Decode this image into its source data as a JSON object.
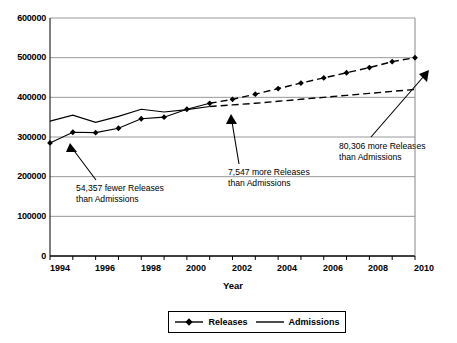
{
  "chart_data": {
    "type": "line",
    "title": "",
    "xlabel": "Year",
    "ylabel": "",
    "xlim": [
      1994,
      2010
    ],
    "ylim": [
      0,
      600000
    ],
    "grid": true,
    "legend_position": "bottom",
    "x": [
      1994,
      1995,
      1996,
      1997,
      1998,
      1999,
      2000,
      2001,
      2002,
      2003,
      2004,
      2005,
      2006,
      2007,
      2008,
      2009,
      2010
    ],
    "xtick_labels": [
      "1994",
      "1996",
      "1998",
      "2000",
      "2002",
      "2004",
      "2006",
      "2008",
      "2010"
    ],
    "xtick_values": [
      1994,
      1996,
      1998,
      2000,
      2002,
      2004,
      2006,
      2008,
      2010
    ],
    "ytick_labels": [
      "0",
      "100000",
      "200000",
      "300000",
      "400000",
      "500000",
      "600000"
    ],
    "ytick_values": [
      0,
      100000,
      200000,
      300000,
      400000,
      500000,
      600000
    ],
    "series": [
      {
        "name": "Releases",
        "marker": "diamond",
        "color": "#000000",
        "solid_through": 2001,
        "values": [
          285000,
          312000,
          311000,
          322000,
          346000,
          350000,
          370000,
          385000,
          395000,
          408000,
          422000,
          436000,
          449000,
          462000,
          475000,
          490000,
          500000
        ]
      },
      {
        "name": "Admissions",
        "marker": "none",
        "color": "#000000",
        "solid_through": 2001,
        "values": [
          340000,
          355000,
          337000,
          352000,
          370000,
          363000,
          369000,
          377000,
          381000,
          385000,
          390000,
          395000,
          400000,
          405000,
          410000,
          415000,
          420000
        ]
      }
    ],
    "annotations": [
      {
        "id": "annotation-1994",
        "line1": "54,357 fewer Releases",
        "line2": "than Admissions",
        "points_to_year": 1994,
        "points_to_value": 285000
      },
      {
        "id": "annotation-2001",
        "line1": "7,547 more Releases",
        "line2": "than Admissions",
        "points_to_year": 2001,
        "points_to_value": 385000
      },
      {
        "id": "annotation-2010",
        "line1": "80,306 more Releases",
        "line2": "than Admissions",
        "points_to_year": 2010,
        "points_to_value": 500000
      }
    ]
  },
  "legend": {
    "items": [
      {
        "label": "Releases"
      },
      {
        "label": "Admissions"
      }
    ]
  }
}
